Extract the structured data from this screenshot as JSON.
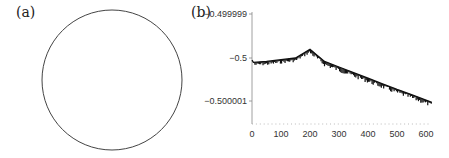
{
  "panels": {
    "a": {
      "label": "(a)"
    },
    "b": {
      "label": "(b)"
    }
  },
  "chart_data": [
    {
      "panel": "(a)",
      "type": "scatter",
      "title": "",
      "description": "closed circular curve",
      "shape": "circle",
      "xlabel": "",
      "ylabel": ""
    },
    {
      "panel": "(b)",
      "type": "line",
      "title": "",
      "xlabel": "",
      "ylabel": "",
      "x_ticks": [
        0,
        100,
        200,
        300,
        400,
        500,
        600
      ],
      "y_ticks": [
        -0.499999,
        -0.5,
        -0.500001
      ],
      "y_tick_labels": [
        "-0.499999",
        "-0.5",
        "-0.500001"
      ],
      "xlim": [
        0,
        630
      ],
      "ylim": [
        -0.5000015,
        -0.499999
      ],
      "series": [
        {
          "name": "signal",
          "x": [
            0,
            5,
            50,
            100,
            150,
            200,
            250,
            300,
            350,
            400,
            450,
            500,
            550,
            600,
            620
          ],
          "values": [
            -0.50000005,
            -0.5000001,
            -0.50000008,
            -0.50000004,
            -0.5,
            -0.4999998,
            -0.50000008,
            -0.50000021,
            -0.50000034,
            -0.50000047,
            -0.5000006,
            -0.50000073,
            -0.50000085,
            -0.50000098,
            -0.50000103
          ]
        }
      ],
      "grid": false,
      "legend": null
    }
  ],
  "axis_text": {
    "y0": "−0.499999",
    "y1": "−0.5",
    "y2": "−0.500001",
    "x0": "0",
    "x1": "100",
    "x2": "200",
    "x3": "300",
    "x4": "400",
    "x5": "500",
    "x6": "600"
  }
}
